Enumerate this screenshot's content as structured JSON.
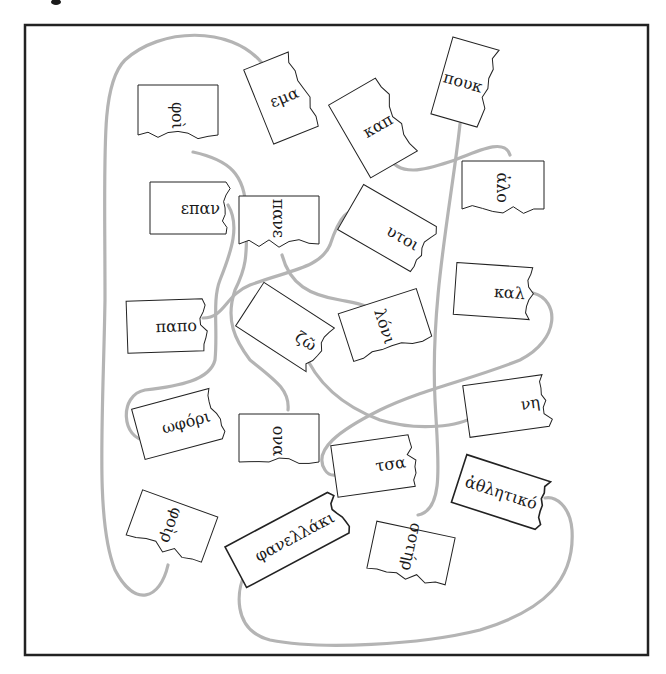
{
  "figure": {
    "frame": {
      "x": 25,
      "y": 25,
      "w": 623,
      "h": 630
    },
    "cord_color": "#b4b4b4",
    "tags": [
      {
        "id": "fragment-1",
        "text": "φοὶ",
        "cx": 178,
        "cy": 110,
        "w": 50,
        "h": 80,
        "rot": 90
      },
      {
        "id": "fragment-2",
        "text": "εμα",
        "cx": 281,
        "cy": 98,
        "w": 48,
        "h": 80,
        "rot": -22
      },
      {
        "id": "fragment-3",
        "text": "καπ",
        "cx": 373,
        "cy": 128,
        "w": 54,
        "h": 84,
        "rot": -30
      },
      {
        "id": "fragment-4",
        "text": "πουκ",
        "cx": 465,
        "cy": 82,
        "w": 48,
        "h": 80,
        "rot": 16
      },
      {
        "id": "fragment-5",
        "text": "ἀλο",
        "cx": 503,
        "cy": 185,
        "w": 48,
        "h": 82,
        "rot": 90
      },
      {
        "id": "fragment-6",
        "text": "επαν",
        "cx": 188,
        "cy": 208,
        "w": 76,
        "h": 52,
        "rot": 0
      },
      {
        "id": "fragment-7",
        "text": "πανε",
        "cx": 279,
        "cy": 220,
        "w": 48,
        "h": 80,
        "rot": 90
      },
      {
        "id": "fragment-8",
        "text": "υτοι",
        "cx": 387,
        "cy": 228,
        "w": 84,
        "h": 52,
        "rot": 30
      },
      {
        "id": "fragment-9",
        "text": "καλ",
        "cx": 493,
        "cy": 291,
        "w": 76,
        "h": 52,
        "rot": 4
      },
      {
        "id": "fragment-10",
        "text": "παπο",
        "cx": 165,
        "cy": 326,
        "w": 76,
        "h": 52,
        "rot": -2
      },
      {
        "id": "fragment-11",
        "text": "ζῶ",
        "cx": 285,
        "cy": 327,
        "w": 84,
        "h": 52,
        "rot": 33
      },
      {
        "id": "fragment-12",
        "text": "λόνι",
        "cx": 385,
        "cy": 325,
        "w": 50,
        "h": 82,
        "rot": 72
      },
      {
        "id": "fragment-13",
        "text": "ωφόρι",
        "cx": 177,
        "cy": 424,
        "w": 80,
        "h": 52,
        "rot": -15
      },
      {
        "id": "fragment-14",
        "text": "ονα",
        "cx": 279,
        "cy": 438,
        "w": 48,
        "h": 80,
        "rot": 90
      },
      {
        "id": "fragment-15",
        "text": "νη",
        "cx": 506,
        "cy": 406,
        "w": 80,
        "h": 52,
        "rot": -8
      },
      {
        "id": "fragment-16",
        "text": "τσα",
        "cx": 373,
        "cy": 466,
        "w": 78,
        "h": 52,
        "rot": -8
      },
      {
        "id": "fragment-17",
        "text": "ἀθλητικό",
        "cx": 501,
        "cy": 492,
        "w": 88,
        "h": 50,
        "rot": 18
      },
      {
        "id": "fragment-18",
        "text": "φοὶρ",
        "cx": 172,
        "cy": 526,
        "w": 48,
        "h": 80,
        "rot": 110
      },
      {
        "id": "fragment-19",
        "text": "φανελλάκι",
        "cx": 287,
        "cy": 540,
        "w": 116,
        "h": 46,
        "rot": -28
      },
      {
        "id": "fragment-20",
        "text": "σοτήρ",
        "cx": 411,
        "cy": 553,
        "w": 48,
        "h": 80,
        "rot": 102
      }
    ]
  }
}
